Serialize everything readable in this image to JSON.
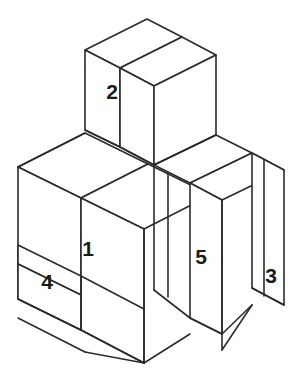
{
  "figure": {
    "type": "isometric-3d-block-diagram",
    "background_color": "#ffffff",
    "line_color": "#2b2b2b",
    "label_color": "#1a1a1a",
    "line_width": 1.6,
    "canvas": {
      "width": 305,
      "height": 380
    }
  },
  "blocks": [
    {
      "id": "block-1",
      "label": "1",
      "label_x": 88,
      "label_y": 250,
      "description": "large front-left slab, front-left vertical face"
    },
    {
      "id": "block-2",
      "label": "2",
      "label_x": 112,
      "label_y": 93,
      "description": "upper raised cube on top of assembly"
    },
    {
      "id": "block-3",
      "label": "3",
      "label_x": 271,
      "label_y": 277,
      "description": "rightmost tall narrow slab"
    },
    {
      "id": "block-4",
      "label": "4",
      "label_x": 47,
      "label_y": 283,
      "description": "lower-left small step face"
    },
    {
      "id": "block-5",
      "label": "5",
      "label_x": 201,
      "label_y": 258,
      "description": "narrow middle-right vertical slab"
    }
  ],
  "faces": [
    {
      "name": "block2-top-left-strip",
      "points": "85,50 147,19 182,37 120,68"
    },
    {
      "name": "block2-top-right-strip",
      "points": "120,68 182,37 216,55 154,86"
    },
    {
      "name": "block2-front-left-face",
      "points": "85,50 120,68 120,147 85,130"
    },
    {
      "name": "block2-front-left-face-wide",
      "points": "120,68 154,86 154,165 120,147"
    },
    {
      "name": "block2-right-face",
      "points": "154,86 216,55 216,135 154,165"
    },
    {
      "name": "main-top-strip-a",
      "points": "18,167 85,133 148,164 81,198"
    },
    {
      "name": "main-top-strip-b",
      "points": "81,198 148,164 211,195 144,229"
    },
    {
      "name": "step-top-right-a",
      "points": "154,165 216,135 252,153 190,183"
    },
    {
      "name": "step-top-right-b",
      "points": "190,183 252,153 284,170 222,200"
    },
    {
      "name": "block1-front-face",
      "points": "18,167 81,198 81,330 18,299"
    },
    {
      "name": "block1-front-face-lower",
      "points": "81,198 144,229 144,363 81,330"
    },
    {
      "name": "block4-face-upper",
      "points": "18,245 81,276 81,295 18,264"
    },
    {
      "name": "block4-face-lower",
      "points": "18,264 81,295 81,330 18,299"
    },
    {
      "name": "block5-face",
      "points": "190,183 222,200 222,334 190,318"
    },
    {
      "name": "block3-face",
      "points": "252,153 284,170 284,305 252,288"
    }
  ],
  "edges": [
    {
      "name": "edge-block2-vertical-left",
      "d": "M85,50 L85,130"
    },
    {
      "name": "edge-block2-vertical-mid",
      "d": "M120,68 L120,147"
    },
    {
      "name": "edge-block2-vertical-mid2",
      "d": "M154,86 L154,165"
    },
    {
      "name": "edge-block2-vertical-right",
      "d": "M216,55 L216,135"
    },
    {
      "name": "edge-main-vertical-left",
      "d": "M18,167 L18,318"
    },
    {
      "name": "edge-main-vertical-mid",
      "d": "M81,198 L81,363"
    },
    {
      "name": "edge-main-front",
      "d": "M144,229 L144,363"
    },
    {
      "name": "edge-step-vertical",
      "d": "M190,183 L190,334"
    },
    {
      "name": "edge-step-vertical2",
      "d": "M222,200 L222,350"
    },
    {
      "name": "edge-right-vertical",
      "d": "M252,153 L252,305"
    },
    {
      "name": "edge-right-far-vertical",
      "d": "M284,170 L284,305"
    },
    {
      "name": "edge-bottom-left",
      "d": "M18,318 L85,352"
    },
    {
      "name": "edge-bottom-mid",
      "d": "M85,352 L144,363"
    },
    {
      "name": "edge-bottom-step",
      "d": "M144,363 L190,334"
    },
    {
      "name": "edge-bottom-right",
      "d": "M222,350 L252,305"
    }
  ]
}
